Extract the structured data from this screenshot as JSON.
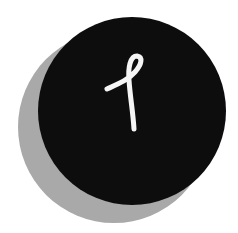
{
  "logo": {
    "glyph": "script-l-loop",
    "colors": {
      "background": "#ffffff",
      "circle": "#0d0d0d",
      "shadow": "#a9a9a9",
      "glyph": "#f5f5f5"
    }
  }
}
